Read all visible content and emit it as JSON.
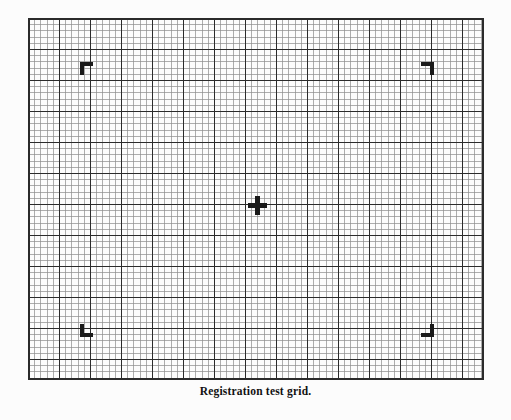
{
  "figure": {
    "caption": "Registration test grid.",
    "background_color": "#fcfcfc",
    "ink_color": "#1a1a1a",
    "minor_line_color": "#8c8c8c",
    "major_line_color": "#2b2b2b"
  },
  "chart_data": {
    "type": "table",
    "title": "Registration test grid.",
    "xlabel": "",
    "ylabel": "",
    "grid": true,
    "legend": "none",
    "plot_area_px": {
      "x": 28,
      "y": 18,
      "width": 456,
      "height": 362
    },
    "cell_size_px": 6.2,
    "minor_cells": {
      "columns": 74,
      "rows": 58
    },
    "major_line_every_n_cells": 5,
    "line_widths_px": {
      "minor": 0.7,
      "major": 1.4,
      "border": 1.6
    },
    "marks": [
      {
        "name": "corner-bracket-top-left",
        "kind": "registration-bracket",
        "orientation": "top-left",
        "center_px": {
          "x": 86,
          "y": 68
        },
        "arm_length_px": 13,
        "stroke_px": 4
      },
      {
        "name": "corner-bracket-top-right",
        "kind": "registration-bracket",
        "orientation": "top-right",
        "center_px": {
          "x": 427,
          "y": 68
        },
        "arm_length_px": 13,
        "stroke_px": 4
      },
      {
        "name": "corner-bracket-bottom-left",
        "kind": "registration-bracket",
        "orientation": "bottom-left",
        "center_px": {
          "x": 86,
          "y": 330
        },
        "arm_length_px": 13,
        "stroke_px": 4
      },
      {
        "name": "corner-bracket-bottom-right",
        "kind": "registration-bracket",
        "orientation": "bottom-right",
        "center_px": {
          "x": 427,
          "y": 330
        },
        "arm_length_px": 13,
        "stroke_px": 4
      },
      {
        "name": "center-crosshair",
        "kind": "crosshair",
        "center_px": {
          "x": 257,
          "y": 205
        },
        "arm_length_px": 19,
        "stroke_px": 5
      }
    ]
  }
}
